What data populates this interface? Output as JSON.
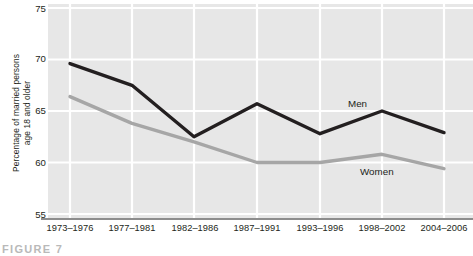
{
  "figure": {
    "caption": "FIGURE 7"
  },
  "axes": {
    "y_title": "Percentage of married persons\nage 18 and older",
    "y_ticks": [
      "75",
      "70",
      "65",
      "60",
      "55"
    ],
    "x_ticks": [
      "1973–1976",
      "1977–1981",
      "1982–1986",
      "1987–1991",
      "1993–1996",
      "1998–2002",
      "2004–2006"
    ]
  },
  "series_labels": {
    "men": "Men",
    "women": "Women"
  },
  "colors": {
    "plot_background": "#e7e7e7",
    "gridline": "#ffffff",
    "men_line": "#231f20",
    "women_line": "#a6a6a6",
    "axis_line": "#8d8d8d",
    "text": "#231f20"
  },
  "chart_data": {
    "type": "line",
    "title": "",
    "xlabel": "",
    "ylabel": "Percentage of married persons age 18 and older",
    "categories": [
      "1973–1976",
      "1977–1981",
      "1982–1986",
      "1987–1991",
      "1993–1996",
      "1998–2002",
      "2004–2006"
    ],
    "series": [
      {
        "name": "Men",
        "color": "#231f20",
        "values": [
          69.6,
          67.5,
          62.5,
          65.7,
          62.8,
          65.0,
          62.9
        ]
      },
      {
        "name": "Women",
        "color": "#a6a6a6",
        "values": [
          66.4,
          63.8,
          62.0,
          60.0,
          60.0,
          60.8,
          59.4
        ]
      }
    ],
    "ylim": [
      55,
      75
    ],
    "yticks": [
      55,
      60,
      65,
      70,
      75
    ],
    "grid": true,
    "legend": "direct-labels"
  }
}
